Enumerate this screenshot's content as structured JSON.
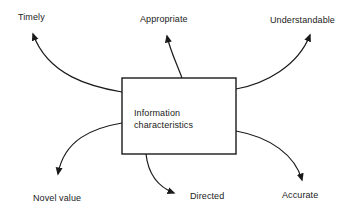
{
  "diagram": {
    "type": "radial-concept-map",
    "center_box": {
      "title": "Information characteristics",
      "line1": "Information",
      "line2": "characteristics"
    },
    "labels": {
      "timely": "Timely",
      "appropriate": "Appropriate",
      "understandable": "Understandable",
      "novel_value": "Novel value",
      "directed": "Directed",
      "accurate": "Accurate"
    },
    "colors": {
      "ink": "#1a1a1a",
      "background": "#ffffff"
    }
  }
}
